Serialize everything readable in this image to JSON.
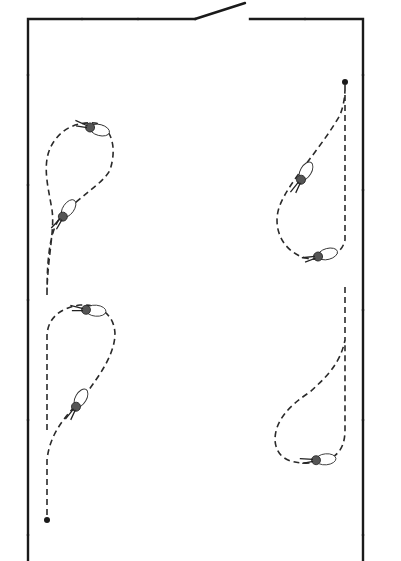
{
  "diagram": {
    "type": "floor-plan-movement",
    "room": {
      "left": 28,
      "right": 363,
      "top": 19,
      "bottom": 561,
      "door": {
        "gap_start": 195,
        "gap_end": 250,
        "leaf_end": [
          245,
          3
        ]
      }
    },
    "paths": [
      {
        "id": "upper-left",
        "start_marker": false
      },
      {
        "id": "upper-right",
        "start_marker": true,
        "start": [
          345,
          82
        ]
      },
      {
        "id": "lower-left",
        "start_marker": true,
        "start": [
          47,
          520
        ]
      },
      {
        "id": "lower-right",
        "start_marker": false
      }
    ],
    "figures_count": 7,
    "colors": {
      "line": "#1a1a1a",
      "background": "#ffffff"
    }
  }
}
